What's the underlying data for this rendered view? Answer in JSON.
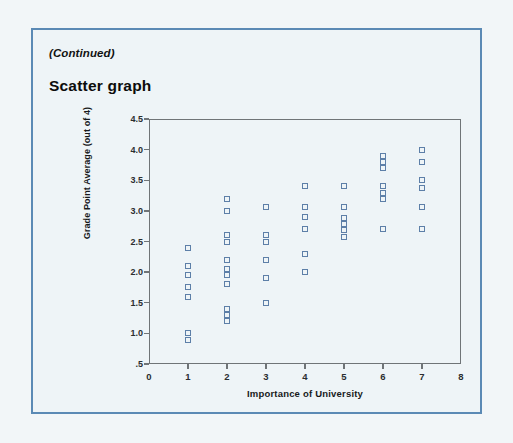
{
  "page": {
    "continued_label": "(Continued)",
    "section_heading": "Scatter graph",
    "border_color": "#5b8ab5",
    "background_color": "#eef4f7"
  },
  "chart_data": {
    "type": "scatter",
    "title": "Scatter graph",
    "xlabel": "Importance of University",
    "ylabel": "Grade Point Average (out of 4)",
    "xlim": [
      0,
      8
    ],
    "ylim": [
      0.5,
      4.5
    ],
    "x_ticks": [
      "0",
      "1",
      "2",
      "3",
      "4",
      "5",
      "6",
      "7",
      "8"
    ],
    "y_ticks": [
      ".5",
      "1.0",
      "1.5",
      "2.0",
      "2.5",
      "3.0",
      "3.5",
      "4.0",
      "4.5"
    ],
    "grid": false,
    "legend": null,
    "marker": "open-square",
    "marker_color": "#5d7fa8",
    "points": [
      {
        "x": 1,
        "y": 2.4
      },
      {
        "x": 1,
        "y": 2.1
      },
      {
        "x": 1,
        "y": 1.95
      },
      {
        "x": 1,
        "y": 1.75
      },
      {
        "x": 1,
        "y": 1.6
      },
      {
        "x": 1,
        "y": 1.0
      },
      {
        "x": 1,
        "y": 0.9
      },
      {
        "x": 2,
        "y": 3.2
      },
      {
        "x": 2,
        "y": 3.0
      },
      {
        "x": 2,
        "y": 2.6
      },
      {
        "x": 2,
        "y": 2.5
      },
      {
        "x": 2,
        "y": 2.2
      },
      {
        "x": 2,
        "y": 2.05
      },
      {
        "x": 2,
        "y": 1.95
      },
      {
        "x": 2,
        "y": 1.8
      },
      {
        "x": 2,
        "y": 1.4
      },
      {
        "x": 2,
        "y": 1.3
      },
      {
        "x": 2,
        "y": 1.2
      },
      {
        "x": 3,
        "y": 3.07
      },
      {
        "x": 3,
        "y": 2.6
      },
      {
        "x": 3,
        "y": 2.5
      },
      {
        "x": 3,
        "y": 2.2
      },
      {
        "x": 3,
        "y": 1.9
      },
      {
        "x": 3,
        "y": 1.5
      },
      {
        "x": 4,
        "y": 3.4
      },
      {
        "x": 4,
        "y": 3.07
      },
      {
        "x": 4,
        "y": 2.9
      },
      {
        "x": 4,
        "y": 2.7
      },
      {
        "x": 4,
        "y": 2.3
      },
      {
        "x": 4,
        "y": 2.0
      },
      {
        "x": 5,
        "y": 3.4
      },
      {
        "x": 5,
        "y": 3.07
      },
      {
        "x": 5,
        "y": 2.88
      },
      {
        "x": 5,
        "y": 2.78
      },
      {
        "x": 5,
        "y": 2.68
      },
      {
        "x": 5,
        "y": 2.58
      },
      {
        "x": 6,
        "y": 3.9
      },
      {
        "x": 6,
        "y": 3.8
      },
      {
        "x": 6,
        "y": 3.7
      },
      {
        "x": 6,
        "y": 3.4
      },
      {
        "x": 6,
        "y": 3.3
      },
      {
        "x": 6,
        "y": 3.2
      },
      {
        "x": 6,
        "y": 2.7
      },
      {
        "x": 7,
        "y": 4.0
      },
      {
        "x": 7,
        "y": 3.8
      },
      {
        "x": 7,
        "y": 3.5
      },
      {
        "x": 7,
        "y": 3.38
      },
      {
        "x": 7,
        "y": 3.07
      },
      {
        "x": 7,
        "y": 2.7
      }
    ]
  }
}
